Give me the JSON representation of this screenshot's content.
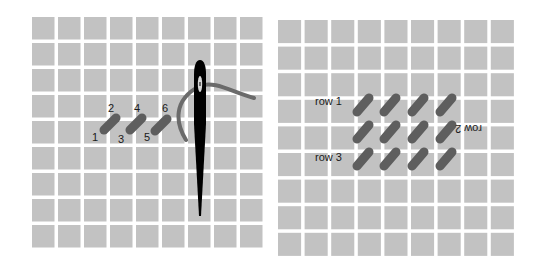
{
  "diagrams": [
    {
      "name": "single-row-stitching",
      "grid": {
        "columns": 9,
        "rows": 9
      },
      "stitch_numbers": [
        "1",
        "2",
        "3",
        "4",
        "5",
        "6"
      ],
      "stitch_count": 3,
      "tools": [
        "needle",
        "thread"
      ]
    },
    {
      "name": "multi-row-stitching",
      "grid": {
        "columns": 9,
        "rows": 9
      },
      "row_labels": [
        "row 1",
        "row 2",
        "row 3"
      ],
      "stitches_per_row": 4,
      "row_count": 3
    }
  ],
  "colors": {
    "canvas_cell": "#c2c2c2",
    "gridline": "#ffffff",
    "stitch": "#5e5e5e",
    "thread": "#6a6a6a",
    "needle": "#000000"
  }
}
